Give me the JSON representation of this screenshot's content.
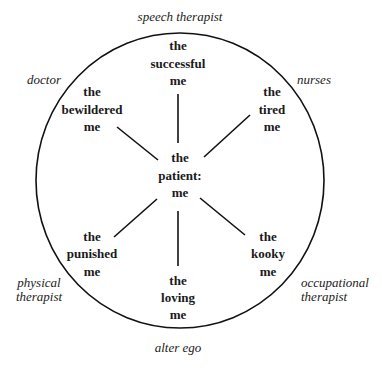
{
  "diagram": {
    "type": "radial",
    "center": {
      "id": "patient",
      "lines": [
        "the",
        "patient:",
        "me"
      ]
    },
    "nodes": [
      {
        "id": "successful",
        "lines": [
          "the",
          "successful",
          "me"
        ],
        "position": "top"
      },
      {
        "id": "tired",
        "lines": [
          "the",
          "tired",
          "me"
        ],
        "position": "top-right"
      },
      {
        "id": "kooky",
        "lines": [
          "the",
          "kooky",
          "me"
        ],
        "position": "bottom-right"
      },
      {
        "id": "loving",
        "lines": [
          "the",
          "loving",
          "me"
        ],
        "position": "bottom"
      },
      {
        "id": "punished",
        "lines": [
          "the",
          "punished",
          "me"
        ],
        "position": "bottom-left"
      },
      {
        "id": "bewildered",
        "lines": [
          "the",
          "bewildered",
          "me"
        ],
        "position": "top-left"
      }
    ],
    "roles": [
      {
        "id": "speech-therapist",
        "lines": [
          "speech therapist"
        ],
        "position": "top"
      },
      {
        "id": "nurses",
        "lines": [
          "nurses"
        ],
        "position": "top-right"
      },
      {
        "id": "occupational-therapist",
        "lines": [
          "occupational",
          "therapist"
        ],
        "position": "bottom-right"
      },
      {
        "id": "alter-ego",
        "lines": [
          "alter ego"
        ],
        "position": "bottom"
      },
      {
        "id": "physical-therapist",
        "lines": [
          "physical",
          "therapist"
        ],
        "position": "bottom-left"
      },
      {
        "id": "doctor",
        "lines": [
          "doctor"
        ],
        "position": "top-left"
      }
    ],
    "edges": [
      [
        "patient",
        "successful"
      ],
      [
        "patient",
        "tired"
      ],
      [
        "patient",
        "kooky"
      ],
      [
        "patient",
        "loving"
      ],
      [
        "patient",
        "punished"
      ],
      [
        "patient",
        "bewildered"
      ]
    ],
    "colors": {
      "stroke": "#111111",
      "text": "#1a1a1a",
      "background": "#ffffff"
    }
  }
}
